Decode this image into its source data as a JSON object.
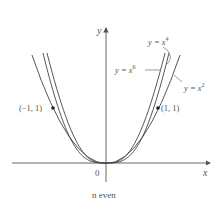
{
  "diagram": {
    "caption": "n even",
    "axes": {
      "x_label": "x",
      "y_label": "y",
      "origin_label": "0"
    },
    "points": [
      {
        "label": "(−1, 1)",
        "x": -1,
        "y": 1
      },
      {
        "label": "(1, 1)",
        "x": 1,
        "y": 1
      }
    ],
    "curves": [
      {
        "name": "y = x^2",
        "label_base": "y = x",
        "exponent": "2"
      },
      {
        "name": "y = x^4",
        "label_base": "y = x",
        "exponent": "4"
      },
      {
        "name": "y = x^6",
        "label_base": "y = x",
        "exponent": "6"
      }
    ],
    "colors": {
      "curve": "#444444",
      "axis": "#555555",
      "text": "#555555"
    }
  }
}
